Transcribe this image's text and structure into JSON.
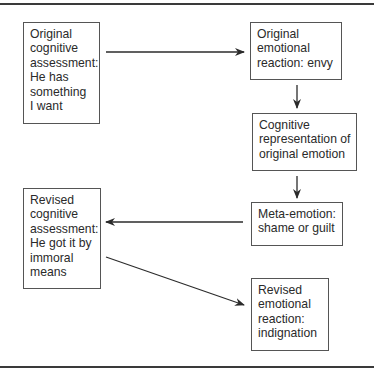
{
  "diagram": {
    "type": "flowchart",
    "nodes": [
      {
        "id": "n1",
        "lines": [
          "Original",
          "cognitive",
          "assessment:",
          "He has",
          "something",
          "I want"
        ]
      },
      {
        "id": "n2",
        "lines": [
          "Original",
          "emotional",
          "reaction: envy"
        ]
      },
      {
        "id": "n3",
        "lines": [
          "Cognitive",
          "representation of",
          "original emotion"
        ]
      },
      {
        "id": "n4",
        "lines": [
          "Meta-emotion:",
          "shame or guilt"
        ]
      },
      {
        "id": "n5",
        "lines": [
          "Revised",
          "cognitive",
          "assessment:",
          "He got it by",
          "immoral",
          "means"
        ]
      },
      {
        "id": "n6",
        "lines": [
          "Revised",
          "emotional",
          "reaction:",
          "indignation"
        ]
      }
    ],
    "edges": [
      {
        "from": "n1",
        "to": "n2"
      },
      {
        "from": "n2",
        "to": "n3"
      },
      {
        "from": "n3",
        "to": "n4"
      },
      {
        "from": "n4",
        "to": "n5"
      },
      {
        "from": "n5",
        "to": "n6"
      }
    ],
    "colors": {
      "line": "#2b2b2b",
      "border": "#555555",
      "background": "#ffffff"
    }
  }
}
